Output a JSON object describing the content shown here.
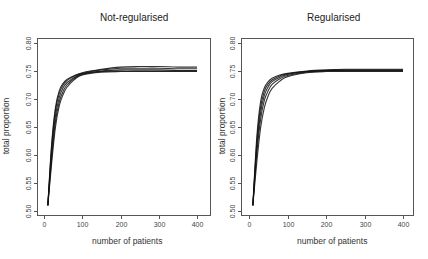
{
  "chart_data": [
    {
      "type": "line",
      "title": "Not-regularised",
      "xlabel": "number of patients",
      "ylabel": "total proportion",
      "xlim": [
        0,
        400
      ],
      "ylim": [
        0.5,
        0.8
      ],
      "x_ticks": [
        0,
        100,
        200,
        300,
        400
      ],
      "y_ticks": [
        "0.50",
        "0.55",
        "0.60",
        "0.65",
        "0.70",
        "0.75",
        "0.80"
      ],
      "grid": false,
      "legend": "none",
      "x": [
        10,
        20,
        30,
        40,
        50,
        60,
        80,
        100,
        150,
        200,
        250,
        300,
        350,
        400
      ],
      "series": [
        {
          "name": "curve 1",
          "values": [
            0.51,
            0.62,
            0.685,
            0.715,
            0.728,
            0.735,
            0.742,
            0.747,
            0.753,
            0.757,
            0.758,
            0.758,
            0.757,
            0.757
          ]
        },
        {
          "name": "curve 2",
          "values": [
            0.51,
            0.615,
            0.68,
            0.71,
            0.725,
            0.733,
            0.741,
            0.746,
            0.752,
            0.755,
            0.755,
            0.755,
            0.754,
            0.754
          ]
        },
        {
          "name": "curve 3",
          "values": [
            0.51,
            0.605,
            0.67,
            0.703,
            0.72,
            0.729,
            0.739,
            0.745,
            0.75,
            0.752,
            0.752,
            0.752,
            0.751,
            0.751
          ]
        },
        {
          "name": "curve 4",
          "values": [
            0.51,
            0.595,
            0.66,
            0.695,
            0.714,
            0.725,
            0.737,
            0.744,
            0.749,
            0.75,
            0.75,
            0.75,
            0.75,
            0.75
          ]
        },
        {
          "name": "curve 5",
          "values": [
            0.51,
            0.585,
            0.65,
            0.688,
            0.708,
            0.721,
            0.735,
            0.743,
            0.748,
            0.749,
            0.749,
            0.749,
            0.749,
            0.749
          ]
        }
      ]
    },
    {
      "type": "line",
      "title": "Regularised",
      "xlabel": "number of patients",
      "ylabel": "total proportion",
      "xlim": [
        0,
        400
      ],
      "ylim": [
        0.5,
        0.8
      ],
      "x_ticks": [
        0,
        100,
        200,
        300,
        400
      ],
      "y_ticks": [
        "0.50",
        "0.55",
        "0.60",
        "0.65",
        "0.70",
        "0.75",
        "0.80"
      ],
      "grid": false,
      "legend": "none",
      "x": [
        10,
        20,
        30,
        40,
        50,
        60,
        80,
        100,
        150,
        200,
        250,
        300,
        350,
        400
      ],
      "series": [
        {
          "name": "curve 1",
          "values": [
            0.51,
            0.63,
            0.695,
            0.72,
            0.731,
            0.737,
            0.743,
            0.746,
            0.75,
            0.752,
            0.753,
            0.753,
            0.753,
            0.753
          ]
        },
        {
          "name": "curve 2",
          "values": [
            0.51,
            0.62,
            0.685,
            0.714,
            0.727,
            0.734,
            0.741,
            0.745,
            0.749,
            0.751,
            0.752,
            0.752,
            0.752,
            0.752
          ]
        },
        {
          "name": "curve 3",
          "values": [
            0.51,
            0.61,
            0.675,
            0.707,
            0.722,
            0.731,
            0.739,
            0.744,
            0.749,
            0.751,
            0.751,
            0.751,
            0.751,
            0.751
          ]
        },
        {
          "name": "curve 4",
          "values": [
            0.51,
            0.6,
            0.663,
            0.698,
            0.715,
            0.726,
            0.736,
            0.742,
            0.748,
            0.75,
            0.75,
            0.75,
            0.75,
            0.75
          ]
        },
        {
          "name": "curve 5",
          "values": [
            0.51,
            0.585,
            0.648,
            0.685,
            0.706,
            0.719,
            0.732,
            0.74,
            0.747,
            0.749,
            0.749,
            0.749,
            0.749,
            0.749
          ]
        }
      ]
    }
  ]
}
